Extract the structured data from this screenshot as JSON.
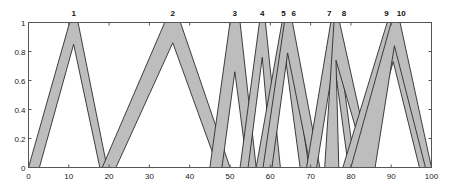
{
  "chart_data": {
    "type": "area",
    "title": "",
    "xlabel": "",
    "ylabel": "",
    "xlim": [
      0,
      100
    ],
    "ylim": [
      0,
      1
    ],
    "grid": false,
    "x_ticks": [
      0,
      10,
      20,
      30,
      40,
      50,
      60,
      70,
      80,
      90,
      100
    ],
    "y_ticks": [
      0,
      0.2,
      0.4,
      0.6,
      0.8,
      1
    ],
    "x_tick_labels": [
      "0",
      "10",
      "20",
      "30",
      "40",
      "50",
      "60",
      "70",
      "80",
      "90",
      "100"
    ],
    "y_tick_labels": [
      "0",
      "0.2",
      "0.4",
      "0.6",
      "0.8",
      "1"
    ],
    "series": [
      {
        "name": "1",
        "label_x": 11.2,
        "upper": [
          [
            0,
            0
          ],
          [
            10.2,
            1
          ],
          [
            12.3,
            1
          ],
          [
            19.5,
            0
          ]
        ],
        "lower": [
          [
            2.7,
            0
          ],
          [
            11.2,
            0.85
          ],
          [
            17.7,
            0
          ]
        ]
      },
      {
        "name": "2",
        "label_x": 35.8,
        "upper": [
          [
            18.3,
            0
          ],
          [
            33.8,
            1
          ],
          [
            37.7,
            1
          ],
          [
            50,
            0
          ]
        ],
        "lower": [
          [
            21.7,
            0
          ],
          [
            35.8,
            0.86
          ],
          [
            47,
            0
          ]
        ]
      },
      {
        "name": "3",
        "label_x": 51.2,
        "upper": [
          [
            45,
            0
          ],
          [
            50,
            1
          ],
          [
            52.5,
            1
          ],
          [
            56.5,
            0
          ]
        ],
        "lower": [
          [
            48,
            0
          ],
          [
            51.2,
            0.66
          ],
          [
            54.3,
            0
          ]
        ]
      },
      {
        "name": "4",
        "label_x": 58,
        "upper": [
          [
            52.5,
            0
          ],
          [
            57.3,
            1
          ],
          [
            58.8,
            1
          ],
          [
            62.5,
            0
          ]
        ],
        "lower": [
          [
            54.5,
            0
          ],
          [
            58,
            0.76
          ],
          [
            60.4,
            0
          ]
        ]
      },
      {
        "name": "5",
        "label_x": 63.3,
        "upper": [
          [
            56.5,
            0
          ],
          [
            62.9,
            1
          ],
          [
            64.3,
            1
          ],
          [
            69.6,
            0
          ]
        ],
        "lower": [
          [
            59,
            0
          ],
          [
            63.6,
            0.79
          ],
          [
            67.4,
            0
          ]
        ]
      },
      {
        "name": "6",
        "label_x": 65.8,
        "upper": [
          [
            58.2,
            0
          ],
          [
            63.5,
            1
          ],
          [
            65.5,
            1
          ],
          [
            72.3,
            0
          ]
        ],
        "lower": [
          [
            60.4,
            0
          ],
          [
            64.3,
            0.79
          ],
          [
            70,
            0
          ]
        ]
      },
      {
        "name": "7",
        "label_x": 74.6,
        "upper": [
          [
            69,
            0
          ],
          [
            75,
            1
          ],
          [
            76.2,
            1
          ],
          [
            81,
            0
          ]
        ],
        "lower": [
          [
            71.5,
            0
          ],
          [
            75.8,
            0.74
          ],
          [
            79.4,
            0
          ]
        ]
      },
      {
        "name": "8",
        "label_x": 78.3,
        "upper": [
          [
            73.5,
            0
          ],
          [
            75.8,
            1
          ],
          [
            77.2,
            1
          ],
          [
            85.2,
            0
          ]
        ],
        "lower": [
          [
            77,
            0
          ],
          [
            76.3,
            0.74
          ],
          [
            84,
            0
          ]
        ]
      },
      {
        "name": "9",
        "label_x": 88.8,
        "upper": [
          [
            78,
            0
          ],
          [
            89,
            1
          ],
          [
            91.2,
            1
          ],
          [
            99,
            0
          ]
        ],
        "lower": [
          [
            83,
            0
          ],
          [
            90.5,
            0.73
          ],
          [
            97,
            0
          ]
        ]
      },
      {
        "name": "10",
        "label_x": 92.5,
        "upper": [
          [
            80,
            0
          ],
          [
            90,
            1
          ],
          [
            92.2,
            1
          ],
          [
            100,
            0
          ]
        ],
        "lower": [
          [
            86,
            0
          ],
          [
            90.8,
            0.84
          ],
          [
            98.5,
            0
          ]
        ]
      }
    ],
    "colors": {
      "fill": "#bdbdbd",
      "edge": "#2b2b2b",
      "axis": "#555555"
    }
  }
}
